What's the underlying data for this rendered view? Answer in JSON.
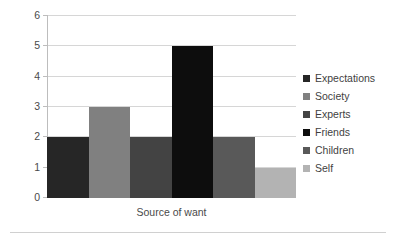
{
  "chart_data": {
    "type": "bar",
    "title": "",
    "subtitle": "",
    "xlabel": "Source of want",
    "ylabel": "",
    "categories": [
      "Expectations",
      "Society",
      "Experts",
      "Friends",
      "Children",
      "Self"
    ],
    "values": [
      2,
      3,
      2,
      5,
      2,
      1
    ],
    "series": [
      {
        "name": "Source of want",
        "values": [
          2,
          3,
          2,
          5,
          2,
          1
        ]
      }
    ],
    "ylim": [
      0,
      6
    ],
    "yticks": [
      0,
      1,
      2,
      3,
      4,
      5,
      6
    ],
    "ytick_labels": [
      "0",
      "1",
      "2",
      "3",
      "4",
      "5",
      "6"
    ],
    "xticks": [],
    "xtick_labels": [],
    "grid": "horizontal",
    "legend_position": "right",
    "bar_gap": "none",
    "colors": [
      "#262626",
      "#808080",
      "#434343",
      "#0d0d0d",
      "#595959",
      "#b3b3b3"
    ],
    "gridline_color": "#d6d6d6",
    "axis_color": "#bdbdbd",
    "text_color": "#3f3f3f",
    "background": "#ffffff"
  },
  "legend": {
    "items": [
      {
        "label": "Expectations",
        "color": "#262626"
      },
      {
        "label": "Society",
        "color": "#808080"
      },
      {
        "label": "Experts",
        "color": "#434343"
      },
      {
        "label": "Friends",
        "color": "#0d0d0d"
      },
      {
        "label": "Children",
        "color": "#595959"
      },
      {
        "label": "Self",
        "color": "#b3b3b3"
      }
    ]
  },
  "axes": {
    "x_title": "Source of want",
    "y_labels": [
      "6",
      "5",
      "4",
      "3",
      "2",
      "1",
      "0"
    ]
  }
}
